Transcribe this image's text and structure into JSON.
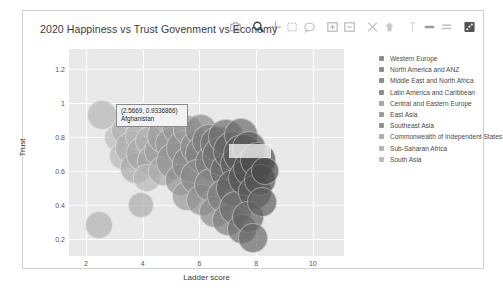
{
  "card": {
    "title": "2020 Happiness vs Trust Govenment vs Economy"
  },
  "modebar": {
    "buttons": [
      {
        "name": "camera-icon",
        "label": "Download plot as a png",
        "active": false
      },
      {
        "name": "zoom-icon",
        "label": "Zoom",
        "active": true
      },
      {
        "name": "pan-icon",
        "label": "Pan",
        "active": false
      },
      {
        "name": "zoom-box-icon",
        "label": "Box Select",
        "active": false
      },
      {
        "name": "lasso-icon",
        "label": "Lasso Select",
        "active": false
      },
      {
        "name": "zoom-in-icon",
        "label": "Zoom in",
        "active": false
      },
      {
        "name": "zoom-out-icon",
        "label": "Zoom out",
        "active": false
      },
      {
        "name": "autoscale-icon",
        "label": "Autoscale",
        "active": false
      },
      {
        "name": "reset-axes-icon",
        "label": "Reset axes",
        "active": false
      },
      {
        "name": "spike-lines-icon",
        "label": "Toggle Spike Lines",
        "active": false
      },
      {
        "name": "hover-compare-icon",
        "label": "Show closest data on hover",
        "active": false
      },
      {
        "name": "hover-closest-icon",
        "label": "Compare data on hover",
        "active": false
      },
      {
        "name": "plotly-logo-icon",
        "label": "Produced with Plotly",
        "active": true
      }
    ]
  },
  "chart_data": {
    "type": "scatter",
    "title": "2020 Happiness vs Trust Govenment vs Economy",
    "xlabel": "Ladder score",
    "ylabel": "Trust",
    "xlim": [
      1.4,
      11.1
    ],
    "ylim": [
      0.1,
      1.32
    ],
    "xticks": [
      2,
      4,
      6,
      8,
      10
    ],
    "yticks": [
      0.2,
      0.4,
      0.6,
      0.8,
      1,
      1.2
    ],
    "grid": true,
    "legend_position": "right",
    "size_encodes": "Economy (GDP per capita)",
    "legend": [
      {
        "name": "Western Europe",
        "color": "#8d8d8d"
      },
      {
        "name": "North America and ANZ",
        "color": "#8d8d8d"
      },
      {
        "name": "Middle East and North Africa",
        "color": "#8d8d8d"
      },
      {
        "name": "Latin America and Caribbean",
        "color": "#8d8d8d"
      },
      {
        "name": "Central and Eastern Europe",
        "color": "#a6a6a6"
      },
      {
        "name": "East Asia",
        "color": "#9b9b9b"
      },
      {
        "name": "Southeast Asia",
        "color": "#909090"
      },
      {
        "name": "Commonwealth of Independent States",
        "color": "#b0b0b0"
      },
      {
        "name": "Sub-Saharan Africa",
        "color": "#b4b4b4"
      },
      {
        "name": "South Asia",
        "color": "#bdbdbd"
      }
    ],
    "points": [
      {
        "x": 2.5669,
        "y": 0.9336866,
        "r": 15,
        "c": "#b9b9b9",
        "o": 0.75
      },
      {
        "x": 3.1,
        "y": 0.795,
        "r": 13,
        "c": "#bdbdbd",
        "o": 0.72
      },
      {
        "x": 3.45,
        "y": 0.84,
        "r": 16,
        "c": "#b2b2b2",
        "o": 0.7
      },
      {
        "x": 3.3,
        "y": 0.69,
        "r": 14,
        "c": "#b8b8b8",
        "o": 0.7
      },
      {
        "x": 3.62,
        "y": 0.735,
        "r": 17,
        "c": "#aeaeae",
        "o": 0.7
      },
      {
        "x": 3.9,
        "y": 0.805,
        "r": 15,
        "c": "#b5b5b5",
        "o": 0.7
      },
      {
        "x": 3.75,
        "y": 0.62,
        "r": 16,
        "c": "#aaaaaa",
        "o": 0.7
      },
      {
        "x": 4.05,
        "y": 0.7,
        "r": 18,
        "c": "#a8a8a8",
        "o": 0.7
      },
      {
        "x": 4.25,
        "y": 0.78,
        "r": 15,
        "c": "#b0b0b0",
        "o": 0.7
      },
      {
        "x": 4.4,
        "y": 0.66,
        "r": 17,
        "c": "#a4a4a4",
        "o": 0.7
      },
      {
        "x": 4.15,
        "y": 0.56,
        "r": 14,
        "c": "#b6b6b6",
        "o": 0.7
      },
      {
        "x": 4.6,
        "y": 0.72,
        "r": 16,
        "c": "#a0a0a0",
        "o": 0.7
      },
      {
        "x": 4.8,
        "y": 0.81,
        "r": 18,
        "c": "#9c9c9c",
        "o": 0.7
      },
      {
        "x": 4.7,
        "y": 0.6,
        "r": 15,
        "c": "#ababab",
        "o": 0.7
      },
      {
        "x": 2.45,
        "y": 0.285,
        "r": 14,
        "c": "#b4b4b4",
        "o": 0.72
      },
      {
        "x": 3.95,
        "y": 0.4,
        "r": 13,
        "c": "#aeaeae",
        "o": 0.72
      },
      {
        "x": 5.05,
        "y": 0.76,
        "r": 17,
        "c": "#9a9a9a",
        "o": 0.7
      },
      {
        "x": 5.25,
        "y": 0.855,
        "r": 16,
        "c": "#989898",
        "o": 0.7
      },
      {
        "x": 5.15,
        "y": 0.66,
        "r": 19,
        "c": "#949494",
        "o": 0.7
      },
      {
        "x": 5.45,
        "y": 0.735,
        "r": 18,
        "c": "#909090",
        "o": 0.7
      },
      {
        "x": 5.6,
        "y": 0.845,
        "r": 15,
        "c": "#9e9e9e",
        "o": 0.7
      },
      {
        "x": 5.35,
        "y": 0.545,
        "r": 16,
        "c": "#8f8f8f",
        "o": 0.7
      },
      {
        "x": 5.7,
        "y": 0.64,
        "r": 19,
        "c": "#8a8a8a",
        "o": 0.7
      },
      {
        "x": 5.9,
        "y": 0.745,
        "r": 17,
        "c": "#8d8d8d",
        "o": 0.7
      },
      {
        "x": 5.55,
        "y": 0.455,
        "r": 15,
        "c": "#999999",
        "o": 0.7
      },
      {
        "x": 6.05,
        "y": 0.84,
        "r": 16,
        "c": "#878787",
        "o": 0.7
      },
      {
        "x": 6.2,
        "y": 0.7,
        "r": 20,
        "c": "#828282",
        "o": 0.7
      },
      {
        "x": 5.95,
        "y": 0.565,
        "r": 18,
        "c": "#8b8b8b",
        "o": 0.7
      },
      {
        "x": 6.35,
        "y": 0.78,
        "r": 17,
        "c": "#7e7e7e",
        "o": 0.7
      },
      {
        "x": 6.1,
        "y": 0.43,
        "r": 16,
        "c": "#909090",
        "o": 0.7
      },
      {
        "x": 6.5,
        "y": 0.65,
        "r": 19,
        "c": "#7a7a7a",
        "o": 0.7
      },
      {
        "x": 6.65,
        "y": 0.76,
        "r": 18,
        "c": "#767676",
        "o": 0.7
      },
      {
        "x": 6.4,
        "y": 0.52,
        "r": 17,
        "c": "#848484",
        "o": 0.7
      },
      {
        "x": 6.8,
        "y": 0.69,
        "r": 20,
        "c": "#727272",
        "o": 0.7
      },
      {
        "x": 6.55,
        "y": 0.36,
        "r": 16,
        "c": "#8a8a8a",
        "o": 0.7
      },
      {
        "x": 6.95,
        "y": 0.8,
        "r": 18,
        "c": "#6e6e6e",
        "o": 0.7
      },
      {
        "x": 7.05,
        "y": 0.6,
        "r": 19,
        "c": "#6a6a6a",
        "o": 0.7
      },
      {
        "x": 6.85,
        "y": 0.455,
        "r": 17,
        "c": "#7c7c7c",
        "o": 0.7
      },
      {
        "x": 7.2,
        "y": 0.72,
        "r": 20,
        "c": "#666666",
        "o": 0.7
      },
      {
        "x": 7.0,
        "y": 0.31,
        "r": 16,
        "c": "#7f7f7f",
        "o": 0.7
      },
      {
        "x": 7.35,
        "y": 0.64,
        "r": 18,
        "c": "#626262",
        "o": 0.7
      },
      {
        "x": 7.45,
        "y": 0.815,
        "r": 17,
        "c": "#6c6c6c",
        "o": 0.7
      },
      {
        "x": 7.25,
        "y": 0.5,
        "r": 19,
        "c": "#5e5e5e",
        "o": 0.7
      },
      {
        "x": 7.55,
        "y": 0.7,
        "r": 20,
        "c": "#5a5a5a",
        "o": 0.7
      },
      {
        "x": 7.3,
        "y": 0.385,
        "r": 17,
        "c": "#707070",
        "o": 0.7
      },
      {
        "x": 7.65,
        "y": 0.56,
        "r": 18,
        "c": "#565656",
        "o": 0.7
      },
      {
        "x": 7.75,
        "y": 0.735,
        "r": 17,
        "c": "#5c5c5c",
        "o": 0.7
      },
      {
        "x": 7.5,
        "y": 0.26,
        "r": 15,
        "c": "#6d6d6d",
        "o": 0.7
      },
      {
        "x": 7.85,
        "y": 0.62,
        "r": 19,
        "c": "#525252",
        "o": 0.7
      },
      {
        "x": 7.95,
        "y": 0.48,
        "r": 17,
        "c": "#585858",
        "o": 0.7
      },
      {
        "x": 7.7,
        "y": 0.33,
        "r": 16,
        "c": "#646464",
        "o": 0.7
      },
      {
        "x": 8.05,
        "y": 0.665,
        "r": 18,
        "c": "#4e4e4e",
        "o": 0.7
      },
      {
        "x": 8.15,
        "y": 0.545,
        "r": 16,
        "c": "#545454",
        "o": 0.7
      },
      {
        "x": 7.9,
        "y": 0.205,
        "r": 15,
        "c": "#696969",
        "o": 0.7
      },
      {
        "x": 8.2,
        "y": 0.42,
        "r": 15,
        "c": "#5f5f5f",
        "o": 0.7
      },
      {
        "x": 8.3,
        "y": 0.6,
        "r": 14,
        "c": "#4a4a4a",
        "o": 0.7
      }
    ]
  },
  "tooltip": {
    "coords": "(2.5669, 0.9336866)",
    "name": "Afghanistan"
  }
}
